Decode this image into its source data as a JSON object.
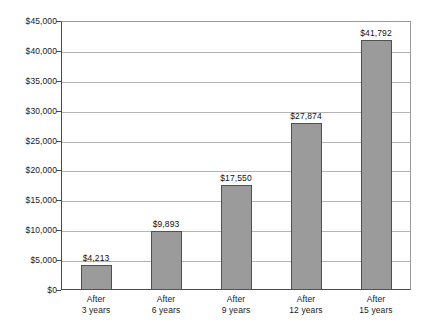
{
  "chart_data": {
    "type": "bar",
    "title": "",
    "subtitle": "",
    "xlabel": "",
    "ylabel": "",
    "categories": [
      "After 3 years",
      "After 6 years",
      "After 9 years",
      "After 12 years",
      "After 15 years"
    ],
    "category_lines": [
      [
        "After",
        "3 years"
      ],
      [
        "After",
        "6 years"
      ],
      [
        "After",
        "9 years"
      ],
      [
        "After",
        "12 years"
      ],
      [
        "After",
        "15 years"
      ]
    ],
    "values": [
      4213,
      9893,
      17550,
      27874,
      41792
    ],
    "data_labels": [
      "$4,213",
      "$9,893",
      "$17,550",
      "$27,874",
      "$41,792"
    ],
    "ylim": [
      0,
      45000
    ],
    "ytick_step": 5000,
    "ytick_values": [
      0,
      5000,
      10000,
      15000,
      20000,
      25000,
      30000,
      35000,
      40000,
      45000
    ],
    "ytick_labels": [
      "$0",
      "$5,000",
      "$10,000",
      "$15,000",
      "$20,000",
      "$25,000",
      "$30,000",
      "$35,000",
      "$40,000",
      "$45,000"
    ],
    "grid": true,
    "legend": false,
    "legend_position": "none",
    "colors": {
      "bar_fill": "#9b9b9b",
      "bar_border": "#515151",
      "gridline": "#b4b4b4",
      "axis": "#4a4a4a",
      "text": "#1a1a1a",
      "background": "#ffffff"
    }
  }
}
